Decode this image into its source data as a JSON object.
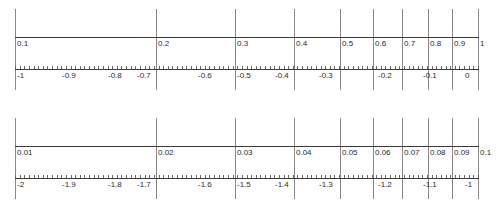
{
  "figure": {
    "background_color": "#ffffff",
    "line_color": "#3a3a3a",
    "gridline_color": "#8a8a8a",
    "label_color": "#2b2b2b"
  },
  "chart_data": [
    {
      "type": "line",
      "title": "Decade 0.1 to 1",
      "xlabel": "",
      "ylabel": "",
      "grid": true,
      "legend": null,
      "axis_scale": "log10",
      "xlim": [
        0.1,
        1
      ],
      "log_xlim": [
        -1,
        0
      ],
      "value_ticks": [
        "0.1",
        "0.2",
        "0.3",
        "0.4",
        "0.5",
        "0.6",
        "0.7",
        "0.8",
        "0.9",
        "1"
      ],
      "value_positions": [
        0.1,
        0.2,
        0.3,
        0.4,
        0.5,
        0.6,
        0.7,
        0.8,
        0.9,
        1.0
      ],
      "log_ticks": [
        "-1",
        "-0.9",
        "-0.8",
        "-0.7",
        "-0.6",
        "-0.5",
        "-0.4",
        "-0.3",
        "-0.2",
        "-0.1",
        "0"
      ],
      "log_positions": [
        -1,
        -0.9,
        -0.8,
        -0.7,
        -0.6,
        -0.5,
        -0.4,
        -0.3,
        -0.2,
        -0.1,
        0
      ]
    },
    {
      "type": "line",
      "title": "Decade 0.01 to 0.1",
      "xlabel": "",
      "ylabel": "",
      "grid": true,
      "legend": null,
      "axis_scale": "log10",
      "xlim": [
        0.01,
        0.1
      ],
      "log_xlim": [
        -2,
        -1
      ],
      "value_ticks": [
        "0.01",
        "0.02",
        "0.03",
        "0.04",
        "0.05",
        "0.06",
        "0.07",
        "0.08",
        "0.09",
        "0.1"
      ],
      "value_positions": [
        0.01,
        0.02,
        0.03,
        0.04,
        0.05,
        0.06,
        0.07,
        0.08,
        0.09,
        0.1
      ],
      "log_ticks": [
        "-2",
        "-1.9",
        "-1.8",
        "-1.7",
        "-1.6",
        "-1.5",
        "-1.4",
        "-1.3",
        "-1.2",
        "-1.1",
        "-1"
      ],
      "log_positions": [
        -2,
        -1.9,
        -1.8,
        -1.7,
        -1.6,
        -1.5,
        -1.4,
        -1.3,
        -1.2,
        -1.1,
        -1
      ]
    }
  ],
  "panels": [
    {
      "name": "top-decade",
      "value_labels": [
        {
          "text": "0.1",
          "x": 17
        },
        {
          "text": "0.2",
          "x": 158
        },
        {
          "text": "0.3",
          "x": 237
        },
        {
          "text": "0.4",
          "x": 296
        },
        {
          "text": "0.5",
          "x": 342
        },
        {
          "text": "0.6",
          "x": 375
        },
        {
          "text": "0.7",
          "x": 404
        },
        {
          "text": "0.8",
          "x": 430
        },
        {
          "text": "0.9",
          "x": 454
        },
        {
          "text": "1",
          "x": 480
        }
      ],
      "log_labels": [
        {
          "text": "-1",
          "x": 17,
          "align": "left"
        },
        {
          "text": "-0.9",
          "x": 62,
          "align": "left"
        },
        {
          "text": "-0.8",
          "x": 108,
          "align": "left"
        },
        {
          "text": "-0.7",
          "x": 137,
          "align": "left"
        },
        {
          "text": "-0.6",
          "x": 198,
          "align": "left"
        },
        {
          "text": "-0.5",
          "x": 237,
          "align": "left"
        },
        {
          "text": "-0.4",
          "x": 275,
          "align": "left"
        },
        {
          "text": "-0.3",
          "x": 319,
          "align": "left"
        },
        {
          "text": "-0.2",
          "x": 378,
          "align": "left"
        },
        {
          "text": "-0.1",
          "x": 423,
          "align": "left"
        },
        {
          "text": "0",
          "x": 465,
          "align": "left"
        }
      ],
      "gridlines_x": [
        15,
        156,
        235,
        294,
        340,
        373,
        402,
        428,
        452,
        478
      ]
    },
    {
      "name": "bottom-decade",
      "value_labels": [
        {
          "text": "0.01",
          "x": 17
        },
        {
          "text": "0.02",
          "x": 158
        },
        {
          "text": "0.03",
          "x": 237
        },
        {
          "text": "0.04",
          "x": 296
        },
        {
          "text": "0.05",
          "x": 342
        },
        {
          "text": "0.06",
          "x": 375
        },
        {
          "text": "0.07",
          "x": 404
        },
        {
          "text": "0.08",
          "x": 430
        },
        {
          "text": "0.09",
          "x": 454
        },
        {
          "text": "0.1",
          "x": 480
        }
      ],
      "log_labels": [
        {
          "text": "-2",
          "x": 17,
          "align": "left"
        },
        {
          "text": "-1.9",
          "x": 62,
          "align": "left"
        },
        {
          "text": "-1.8",
          "x": 108,
          "align": "left"
        },
        {
          "text": "-1.7",
          "x": 137,
          "align": "left"
        },
        {
          "text": "-1.6",
          "x": 198,
          "align": "left"
        },
        {
          "text": "-1.5",
          "x": 237,
          "align": "left"
        },
        {
          "text": "-1.4",
          "x": 275,
          "align": "left"
        },
        {
          "text": "-1.3",
          "x": 319,
          "align": "left"
        },
        {
          "text": "-1.2",
          "x": 378,
          "align": "left"
        },
        {
          "text": "-1.1",
          "x": 423,
          "align": "left"
        },
        {
          "text": "-1",
          "x": 465,
          "align": "left"
        }
      ],
      "gridlines_x": [
        15,
        156,
        235,
        294,
        340,
        373,
        402,
        428,
        452,
        478
      ]
    }
  ]
}
